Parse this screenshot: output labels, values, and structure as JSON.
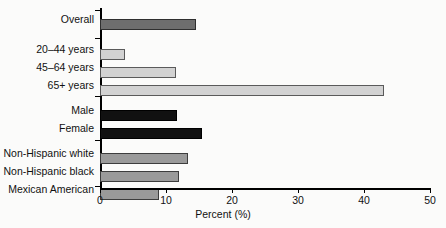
{
  "chart_data": {
    "type": "bar",
    "orientation": "horizontal",
    "title": "",
    "xlabel": "Percent (%)",
    "ylabel": "",
    "xlim": [
      0,
      50
    ],
    "xticks": [
      0,
      10,
      20,
      30,
      40,
      50
    ],
    "xtick_labels": [
      "0",
      "10",
      "20",
      "30",
      "40",
      "50"
    ],
    "grid": false,
    "legend": "none",
    "categories": [
      "Overall",
      "20–44 years",
      "45–64 years",
      "65+ years",
      "Male",
      "Female",
      "Non-Hispanic white",
      "Non-Hispanic black",
      "Mexican American"
    ],
    "values": [
      14.5,
      3.8,
      11.5,
      43.0,
      11.7,
      15.5,
      13.4,
      12.0,
      9.0
    ],
    "bars": [
      {
        "label": "Overall",
        "value": 14.5,
        "style": "dark",
        "group": "total"
      },
      {
        "label": "20–44 years",
        "value": 3.8,
        "style": "light",
        "group": "age"
      },
      {
        "label": "45–64 years",
        "value": 11.5,
        "style": "light",
        "group": "age"
      },
      {
        "label": "65+ years",
        "value": 43.0,
        "style": "light",
        "group": "age"
      },
      {
        "label": "Male",
        "value": 11.7,
        "style": "black",
        "group": "sex"
      },
      {
        "label": "Female",
        "value": 15.5,
        "style": "black",
        "group": "sex"
      },
      {
        "label": "Non-Hispanic white",
        "value": 13.4,
        "style": "mid",
        "group": "race"
      },
      {
        "label": "Non-Hispanic black",
        "value": 12.0,
        "style": "mid",
        "group": "race"
      },
      {
        "label": "Mexican American",
        "value": 9.0,
        "style": "mid",
        "group": "race"
      }
    ],
    "colors": {
      "dark": "#6e6e6e",
      "light": "#d2d2d2",
      "black": "#111111",
      "mid": "#9a9a9a",
      "axis": "#000000",
      "background": "#fbfbfa"
    }
  },
  "axis": {
    "x_title": "Percent (%)",
    "tick_0": "0",
    "tick_1": "10",
    "tick_2": "20",
    "tick_3": "30",
    "tick_4": "40",
    "tick_5": "50"
  },
  "labels": {
    "overall": "Overall",
    "age_20_44": "20–44 years",
    "age_45_64": "45–64 years",
    "age_65_plus": "65+ years",
    "male": "Male",
    "female": "Female",
    "nh_white": "Non-Hispanic white",
    "nh_black": "Non-Hispanic black",
    "mexican_american": "Mexican American"
  }
}
